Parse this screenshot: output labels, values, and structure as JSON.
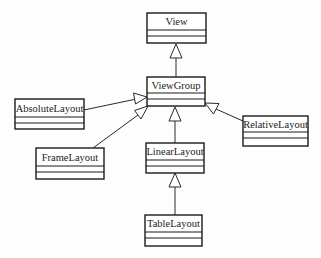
{
  "diagram": {
    "type": "uml-class-hierarchy",
    "relationship": "inheritance (generalization)",
    "colors": {
      "background": "#fdfdfd",
      "stroke": "#1a1a1a",
      "text": "#222222"
    },
    "classes": {
      "view": {
        "name": "View"
      },
      "viewgroup": {
        "name": "ViewGroup"
      },
      "absolutelayout": {
        "name": "AbsoluteLayout"
      },
      "relativelayout": {
        "name": "RelativeLayout"
      },
      "framelayout": {
        "name": "FrameLayout"
      },
      "linearlayout": {
        "name": "LinearLayout"
      },
      "tablelayout": {
        "name": "TableLayout"
      }
    },
    "edges": [
      {
        "from": "ViewGroup",
        "to": "View"
      },
      {
        "from": "AbsoluteLayout",
        "to": "ViewGroup"
      },
      {
        "from": "FrameLayout",
        "to": "ViewGroup"
      },
      {
        "from": "LinearLayout",
        "to": "ViewGroup"
      },
      {
        "from": "RelativeLayout",
        "to": "ViewGroup"
      },
      {
        "from": "TableLayout",
        "to": "LinearLayout"
      }
    ]
  }
}
